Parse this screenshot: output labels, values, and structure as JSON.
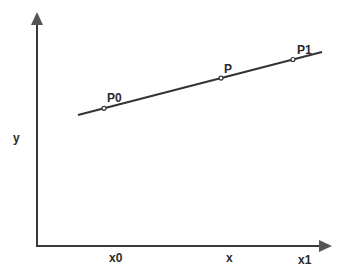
{
  "diagram": {
    "type": "linear-interpolation",
    "axes": {
      "x_label": "x",
      "y_label": "y"
    },
    "points": [
      {
        "id": "P0",
        "label": "P0"
      },
      {
        "id": "P",
        "label": "P"
      },
      {
        "id": "P1",
        "label": "P1"
      }
    ],
    "x_ticks": [
      {
        "id": "x0",
        "label": "x0"
      },
      {
        "id": "x",
        "label": "x"
      },
      {
        "id": "x1",
        "label": "x1"
      }
    ],
    "colors": {
      "line": "#333333",
      "axis": "#3a3a3a",
      "arrow": "#555555",
      "text": "#2a2a2a"
    }
  }
}
